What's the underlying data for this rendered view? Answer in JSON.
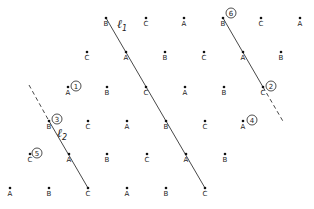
{
  "diagram": {
    "points": [
      {
        "x": 106,
        "y": 18,
        "label": "B"
      },
      {
        "x": 146,
        "y": 18,
        "label": "C"
      },
      {
        "x": 184,
        "y": 18,
        "label": "A"
      },
      {
        "x": 223,
        "y": 18,
        "label": "B"
      },
      {
        "x": 261,
        "y": 18,
        "label": "C"
      },
      {
        "x": 300,
        "y": 18,
        "label": "A"
      },
      {
        "x": 87,
        "y": 52,
        "label": "C"
      },
      {
        "x": 126,
        "y": 52,
        "label": "A"
      },
      {
        "x": 165,
        "y": 52,
        "label": "B"
      },
      {
        "x": 204,
        "y": 52,
        "label": "C"
      },
      {
        "x": 243,
        "y": 52,
        "label": "A"
      },
      {
        "x": 281,
        "y": 52,
        "label": "B"
      },
      {
        "x": 68,
        "y": 87,
        "label": "A"
      },
      {
        "x": 107,
        "y": 87,
        "label": "B"
      },
      {
        "x": 146,
        "y": 87,
        "label": "C"
      },
      {
        "x": 185,
        "y": 87,
        "label": "A"
      },
      {
        "x": 224,
        "y": 87,
        "label": "B"
      },
      {
        "x": 263,
        "y": 87,
        "label": "C"
      },
      {
        "x": 49,
        "y": 121,
        "label": "B"
      },
      {
        "x": 88,
        "y": 121,
        "label": "C"
      },
      {
        "x": 127,
        "y": 121,
        "label": "A"
      },
      {
        "x": 166,
        "y": 121,
        "label": "B"
      },
      {
        "x": 205,
        "y": 121,
        "label": "C"
      },
      {
        "x": 243,
        "y": 121,
        "label": "A"
      },
      {
        "x": 30,
        "y": 154,
        "label": "C"
      },
      {
        "x": 69,
        "y": 154,
        "label": "A"
      },
      {
        "x": 107,
        "y": 154,
        "label": "B"
      },
      {
        "x": 147,
        "y": 154,
        "label": "C"
      },
      {
        "x": 186,
        "y": 154,
        "label": "A"
      },
      {
        "x": 225,
        "y": 154,
        "label": "B"
      },
      {
        "x": 10,
        "y": 188,
        "label": "A"
      },
      {
        "x": 49,
        "y": 188,
        "label": "B"
      },
      {
        "x": 88,
        "y": 188,
        "label": "C"
      },
      {
        "x": 127,
        "y": 188,
        "label": "A"
      },
      {
        "x": 166,
        "y": 188,
        "label": "B"
      },
      {
        "x": 205,
        "y": 188,
        "label": "C"
      }
    ],
    "lines": [
      {
        "name": "l1",
        "style": "solid",
        "x1": 106,
        "y1": 18,
        "x2": 205,
        "y2": 188
      },
      {
        "name": "l2-dashed",
        "style": "dashed",
        "x1": 29,
        "y1": 85,
        "x2": 49,
        "y2": 121
      },
      {
        "name": "l2",
        "style": "solid",
        "x1": 49,
        "y1": 121,
        "x2": 88,
        "y2": 188
      },
      {
        "name": "l3",
        "style": "solid",
        "x1": 223,
        "y1": 18,
        "x2": 263,
        "y2": 87
      },
      {
        "name": "l3-dashed",
        "style": "dashed",
        "x1": 263,
        "y1": 87,
        "x2": 284,
        "y2": 123
      }
    ],
    "line_labels": [
      {
        "text": "ℓ",
        "sub": "1",
        "x": 117,
        "y": 28
      },
      {
        "text": "ℓ",
        "sub": "2",
        "x": 57,
        "y": 137
      }
    ],
    "circled_numbers": [
      {
        "n": "1",
        "x": 76,
        "y": 86
      },
      {
        "n": "2",
        "x": 271,
        "y": 86
      },
      {
        "n": "3",
        "x": 57,
        "y": 119
      },
      {
        "n": "4",
        "x": 252,
        "y": 120
      },
      {
        "n": "5",
        "x": 37,
        "y": 153
      },
      {
        "n": "6",
        "x": 231,
        "y": 13
      }
    ]
  }
}
